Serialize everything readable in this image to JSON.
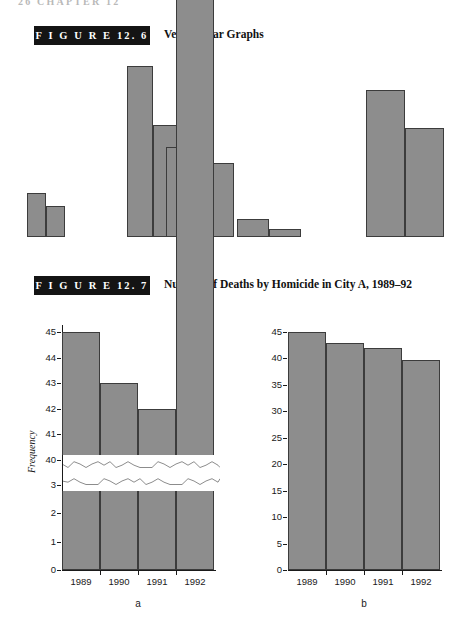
{
  "page": {
    "running_head": "26   CHAPTER 12",
    "width": 474,
    "height": 621,
    "bar_fill": "#8d8d8d",
    "bar_stroke": "#3c3c3c",
    "label_box_fill": "#141414"
  },
  "figures": [
    {
      "id": "12.6",
      "label": "F I G U R E   12. 6",
      "title": "Vertical Bar Graphs"
    },
    {
      "id": "12.7",
      "label": "F I G U R E   12. 7",
      "title": "Number of Deaths by Homicide in City A, 1989–92"
    }
  ],
  "chart_data": [
    {
      "type": "bar",
      "title": "Vertical Bar Graphs",
      "figure": "12.6",
      "xlabel": "",
      "ylabel": "",
      "grid": false,
      "legend": false,
      "note": "Illustrative paired vertical bars, no axes or tick labels shown",
      "categories": [
        "pair-1",
        "pair-2",
        "pair-3",
        "pair-4",
        "pair-5"
      ],
      "series": [
        {
          "name": "left-bar",
          "values": [
            44,
            171,
            90,
            18,
            147
          ]
        },
        {
          "name": "right-bar",
          "values": [
            31,
            112,
            74,
            8,
            109
          ]
        }
      ],
      "bars": [
        {
          "group": 1,
          "side": "left",
          "x": 27,
          "width": 19,
          "top": 193,
          "bottom": 237
        },
        {
          "group": 1,
          "side": "right",
          "x": 46,
          "width": 19,
          "top": 206,
          "bottom": 237
        },
        {
          "group": 2,
          "side": "left",
          "x": 127,
          "width": 26,
          "top": 66,
          "bottom": 237
        },
        {
          "group": 2,
          "side": "right",
          "x": 153,
          "width": 26,
          "top": 125,
          "bottom": 237
        },
        {
          "group": 3,
          "side": "left",
          "x": 166,
          "width": 34,
          "top": 147,
          "bottom": 237
        },
        {
          "group": 3,
          "side": "right",
          "x": 200,
          "width": 34,
          "top": 163,
          "bottom": 237
        },
        {
          "group": 4,
          "side": "left",
          "x": 237,
          "width": 32,
          "top": 219,
          "bottom": 237
        },
        {
          "group": 4,
          "side": "right",
          "x": 269,
          "width": 32,
          "top": 229,
          "bottom": 237
        },
        {
          "group": 5,
          "side": "left",
          "x": 366,
          "width": 39,
          "top": 90,
          "bottom": 237
        },
        {
          "group": 5,
          "side": "right",
          "x": 405,
          "width": 39,
          "top": 128,
          "bottom": 237
        }
      ]
    },
    {
      "type": "bar",
      "figure": "12.7",
      "panel": "a",
      "panel_letter": "a",
      "title": "Number of Deaths by Homicide in City A, 1989–92",
      "xlabel": "",
      "ylabel": "Frequency",
      "categories": [
        "1989",
        "1990",
        "1991",
        "1992"
      ],
      "values": [
        45,
        43,
        42,
        39.8
      ],
      "ytick_labels": [
        "0",
        "1",
        "2",
        "3",
        "40",
        "41",
        "42",
        "43",
        "44",
        "45"
      ],
      "ylim": [
        0,
        45
      ],
      "broken_axis": true,
      "break_between": [
        3,
        40
      ],
      "grid": false,
      "legend": false
    },
    {
      "type": "bar",
      "figure": "12.7",
      "panel": "b",
      "panel_letter": "b",
      "title": "Number of Deaths by Homicide in City A, 1989–92",
      "xlabel": "",
      "ylabel": "",
      "categories": [
        "1989",
        "1990",
        "1991",
        "1992"
      ],
      "values": [
        45,
        43,
        42,
        39.8
      ],
      "ytick_labels": [
        "0",
        "5",
        "10",
        "15",
        "20",
        "25",
        "30",
        "35",
        "40",
        "45"
      ],
      "ylim": [
        0,
        45
      ],
      "broken_axis": false,
      "grid": false,
      "legend": false
    }
  ]
}
